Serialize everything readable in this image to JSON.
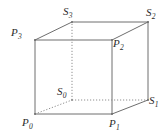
{
  "figure": {
    "kind": "cube-vertex-diagram",
    "stroke_color": "#6e6e6e",
    "hidden_stroke_color": "#8f8f8f",
    "label_color": "#2b2b2b",
    "background": "#ffffff",
    "width": 168,
    "height": 136
  },
  "vertices": [
    {
      "id": "P0",
      "base": "P",
      "sub": "0",
      "face": "front",
      "hidden": false,
      "x": 35,
      "y": 114,
      "label_x": 22,
      "label_y": 117
    },
    {
      "id": "P1",
      "base": "P",
      "sub": "1",
      "face": "front",
      "hidden": false,
      "x": 112,
      "y": 114,
      "label_x": 109,
      "label_y": 118
    },
    {
      "id": "P2",
      "base": "P",
      "sub": "2",
      "face": "front",
      "hidden": false,
      "x": 112,
      "y": 40,
      "label_x": 113,
      "label_y": 38
    },
    {
      "id": "P3",
      "base": "P",
      "sub": "3",
      "face": "front",
      "hidden": false,
      "x": 35,
      "y": 40,
      "label_x": 11,
      "label_y": 27
    },
    {
      "id": "S0",
      "base": "S",
      "sub": "0",
      "face": "back",
      "hidden": true,
      "x": 72,
      "y": 100,
      "label_x": 57,
      "label_y": 86
    },
    {
      "id": "S1",
      "base": "S",
      "sub": "1",
      "face": "back",
      "hidden": false,
      "x": 148,
      "y": 100,
      "label_x": 149,
      "label_y": 95
    },
    {
      "id": "S2",
      "base": "S",
      "sub": "2",
      "face": "back",
      "hidden": false,
      "x": 148,
      "y": 22,
      "label_x": 146,
      "label_y": 7
    },
    {
      "id": "S3",
      "base": "S",
      "sub": "3",
      "face": "back",
      "hidden": false,
      "x": 72,
      "y": 22,
      "label_x": 63,
      "label_y": 6
    }
  ],
  "edges": [
    {
      "from": "P0",
      "to": "P1",
      "style": "solid",
      "name": "edge-p0-p1"
    },
    {
      "from": "P1",
      "to": "P2",
      "style": "solid",
      "name": "edge-p1-p2"
    },
    {
      "from": "P2",
      "to": "P3",
      "style": "solid",
      "name": "edge-p2-p3"
    },
    {
      "from": "P3",
      "to": "P0",
      "style": "solid",
      "name": "edge-p3-p0"
    },
    {
      "from": "S1",
      "to": "S2",
      "style": "solid",
      "name": "edge-s1-s2"
    },
    {
      "from": "S2",
      "to": "S3",
      "style": "solid",
      "name": "edge-s2-s3"
    },
    {
      "from": "P1",
      "to": "S1",
      "style": "solid",
      "name": "edge-p1-s1"
    },
    {
      "from": "P2",
      "to": "S2",
      "style": "solid",
      "name": "edge-p2-s2"
    },
    {
      "from": "P3",
      "to": "S3",
      "style": "solid",
      "name": "edge-p3-s3"
    },
    {
      "from": "S0",
      "to": "S1",
      "style": "dotted",
      "name": "edge-s0-s1-hidden"
    },
    {
      "from": "S0",
      "to": "S3",
      "style": "dotted",
      "name": "edge-s0-s3-hidden"
    },
    {
      "from": "P0",
      "to": "S0",
      "style": "dotted",
      "name": "edge-p0-s0-hidden"
    }
  ]
}
